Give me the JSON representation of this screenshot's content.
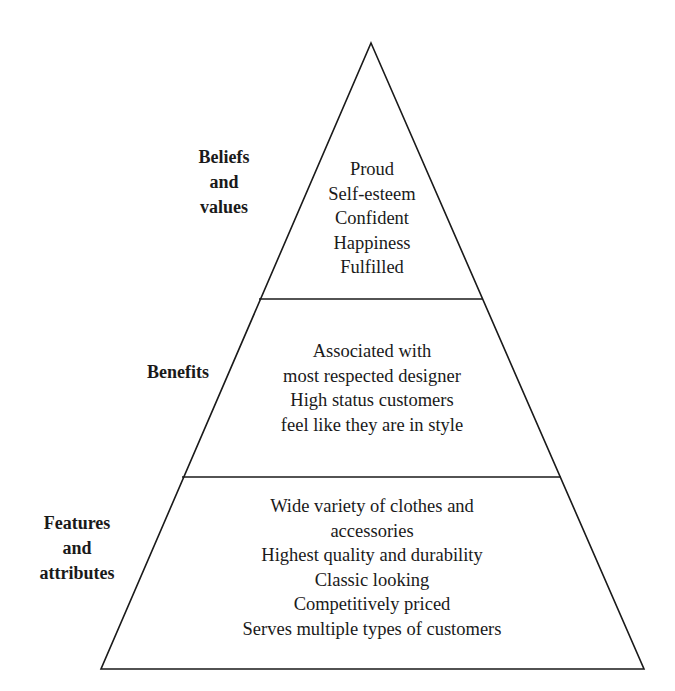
{
  "diagram": {
    "type": "pyramid",
    "tiers": [
      {
        "name": "Beliefs and values",
        "label_lines": [
          "Beliefs",
          "and",
          "values"
        ],
        "items": [
          "Proud",
          "Self-esteem",
          "Confident",
          "Happiness",
          "Fulfilled"
        ]
      },
      {
        "name": "Benefits",
        "label_lines": [
          "Benefits"
        ],
        "items": [
          "Associated with",
          "most respected designer",
          "High status customers",
          "feel like they are in style"
        ]
      },
      {
        "name": "Features and attributes",
        "label_lines": [
          "Features",
          "and",
          "attributes"
        ],
        "items": [
          "Wide variety of clothes and",
          "accessories",
          "Highest quality and durability",
          "Classic looking",
          "Competitively priced",
          "Serves multiple types of customers"
        ]
      }
    ],
    "colors": {
      "line": "#1a1a1a",
      "background": "#ffffff",
      "text": "#1a1a1a"
    }
  }
}
